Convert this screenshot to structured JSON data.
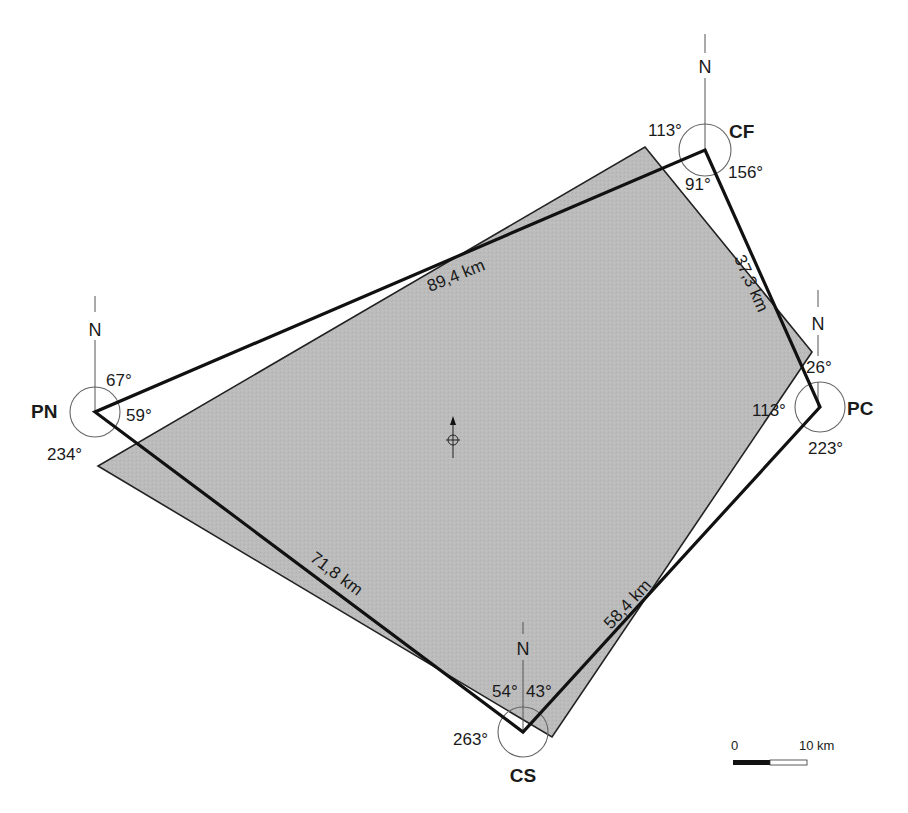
{
  "colors": {
    "image_fill": "#b9b9b9",
    "outline": "#111111",
    "circle": "#555555"
  },
  "image_footprint": {
    "points": "645,147 812,352 552,737 98,466"
  },
  "network": {
    "points": "705,150 820,407 523,732 95,412"
  },
  "stations": {
    "CF": {
      "name": "CF",
      "north_label": "N",
      "angles": {
        "left": "113°",
        "right": "156°",
        "inner": "91°"
      }
    },
    "PC": {
      "name": "PC",
      "north_label": "N",
      "angles": {
        "top": "26°",
        "inner": "113°",
        "bottom": "223°"
      }
    },
    "CS": {
      "name": "CS",
      "north_label": "N",
      "angles": {
        "left_inner": "54°",
        "right_inner": "43°",
        "outer": "263°"
      }
    },
    "PN": {
      "name": "PN",
      "north_label": "N",
      "angles": {
        "top": "67°",
        "inner": "59°",
        "outer": "234°"
      }
    }
  },
  "distances": {
    "PN_CF": "89,4 km",
    "CF_PC": "37,3 km",
    "PN_CS": "71,8 km",
    "CS_PC": "58,4 km"
  },
  "center_marker": {
    "icon": "north-arrow-crosshair-icon"
  },
  "scale_bar": {
    "start_label": "0",
    "end_label": "10 km"
  }
}
